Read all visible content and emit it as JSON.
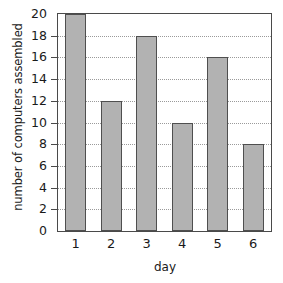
{
  "chart_data": {
    "type": "bar",
    "title": "",
    "subtitle": "",
    "xlabel": "day",
    "ylabel": "number of computers assembled",
    "categories": [
      "1",
      "2",
      "3",
      "4",
      "5",
      "6"
    ],
    "values": [
      20,
      12,
      18,
      10,
      16,
      8
    ],
    "series": [
      {
        "name": "number of computers assembled",
        "values": [
          20,
          12,
          18,
          10,
          16,
          8
        ]
      }
    ],
    "ylim": [
      0,
      20
    ],
    "xlim_categories": 6,
    "y_ticks": [
      0,
      2,
      4,
      6,
      8,
      10,
      12,
      14,
      16,
      18,
      20
    ],
    "y_tick_labels": [
      "0",
      "2",
      "4",
      "6",
      "8",
      "10",
      "12",
      "14",
      "16",
      "18",
      "20"
    ],
    "x_tick_labels": [
      "1",
      "2",
      "3",
      "4",
      "5",
      "6"
    ],
    "grid": "horizontal-dotted",
    "grid_on": true,
    "legend": null,
    "legend_position": "none",
    "annotations": [],
    "colors": {
      "bar_fill": "#b2b2b2",
      "bar_stroke": "#4f4f4f",
      "gridline": "#9a9a9a",
      "axis": "#4a4a4a",
      "background": "#ffffff",
      "text": "#1a1a1a"
    }
  }
}
